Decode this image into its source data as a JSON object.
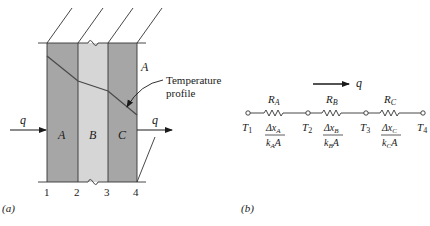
{
  "figure": {
    "panel_a": {
      "label": "(a)",
      "layers": [
        {
          "name": "A",
          "color": "#a6a6a6"
        },
        {
          "name": "B",
          "color": "#d6d6d6"
        },
        {
          "name": "C",
          "color": "#a6a6a6"
        }
      ],
      "interface_numbers": [
        "1",
        "2",
        "3",
        "4"
      ],
      "heat_flow_label_in": "q",
      "heat_flow_label_out": "q",
      "area_label": "A",
      "profile_label_line1": "Temperature",
      "profile_label_line2": "profile"
    },
    "panel_b": {
      "label": "(b)",
      "flow_label": "q",
      "nodes": [
        {
          "T": "T",
          "sub": "1"
        },
        {
          "T": "T",
          "sub": "2"
        },
        {
          "T": "T",
          "sub": "3"
        },
        {
          "T": "T",
          "sub": "4"
        }
      ],
      "resistors": [
        {
          "R": "R",
          "R_sub": "A",
          "num": "Δx",
          "num_sub": "A",
          "den": "k",
          "den_sub": "A",
          "den_tail": "A"
        },
        {
          "R": "R",
          "R_sub": "B",
          "num": "Δx",
          "num_sub": "B",
          "den": "k",
          "den_sub": "B",
          "den_tail": "A"
        },
        {
          "R": "R",
          "R_sub": "C",
          "num": "Δx",
          "num_sub": "C",
          "den": "k",
          "den_sub": "C",
          "den_tail": "A"
        }
      ]
    }
  }
}
